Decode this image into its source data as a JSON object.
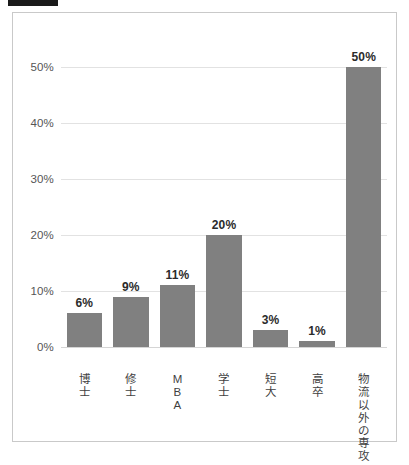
{
  "top_marker": {
    "name": "redacted-title-bar",
    "color": "#1a1a1a"
  },
  "frame": {
    "border_color": "#c9c9c9",
    "background": "#ffffff"
  },
  "chart_data": {
    "type": "bar",
    "title": "",
    "subtitle": "",
    "xlabel": "",
    "ylabel": "",
    "ylim": [
      0,
      55
    ],
    "grid": true,
    "legend": null,
    "bar_color": "#808080",
    "categories": [
      "博士",
      "修士",
      "MBA",
      "学士",
      "短大",
      "高卒",
      "物流以外の専攻"
    ],
    "category_chars": [
      [
        "博",
        "士"
      ],
      [
        "修",
        "士"
      ],
      [
        "M",
        "B",
        "A"
      ],
      [
        "学",
        "士"
      ],
      [
        "短",
        "大"
      ],
      [
        "高",
        "卒"
      ],
      [
        "物",
        "流",
        "以",
        "外",
        "の",
        "専",
        "攻"
      ]
    ],
    "values": [
      6,
      9,
      11,
      20,
      3,
      1,
      50
    ],
    "data_labels": [
      "6%",
      "9%",
      "11%",
      "20%",
      "3%",
      "1%",
      "50%"
    ],
    "yticks": [
      0,
      10,
      20,
      30,
      40,
      50
    ],
    "ytick_labels": [
      "0%",
      "10%",
      "20%",
      "30%",
      "40%",
      "50%"
    ]
  }
}
